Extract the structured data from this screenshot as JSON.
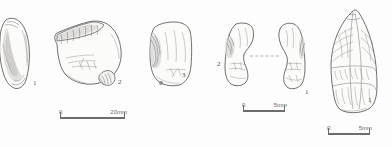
{
  "plate": {
    "title": "Lithic artefact illustration plate",
    "background_color": "#fdfdfd",
    "ink_color": "#5f5f5f"
  },
  "groups": [
    {
      "id": "group-left",
      "label": "Group 1 (artefacts 1-3)",
      "artifacts": [
        {
          "number": "1",
          "name": "flake-artifact-1"
        },
        {
          "number": "2",
          "name": "core-artifact-2"
        },
        {
          "number": "3",
          "name": "flake-artifact-3"
        }
      ],
      "scalebar": {
        "start": "0",
        "end": "20mm",
        "name": "scale-bar-left"
      }
    },
    {
      "id": "group-middle",
      "label": "Group 2 (refitted pieces)",
      "artifacts": [
        {
          "number": "2",
          "name": "refit-piece-left"
        },
        {
          "number": "1",
          "name": "refit-piece-right"
        }
      ],
      "refit_connector": "dashed-refit-line",
      "scalebar": {
        "start": "0",
        "end": "5mm",
        "name": "scale-bar-middle"
      }
    },
    {
      "id": "group-right",
      "label": "Group 3 (biface)",
      "artifacts": [
        {
          "number": "1",
          "name": "biface-artifact-1"
        }
      ],
      "scalebar": {
        "start": "0",
        "end": "5mm",
        "name": "scale-bar-right"
      }
    }
  ]
}
